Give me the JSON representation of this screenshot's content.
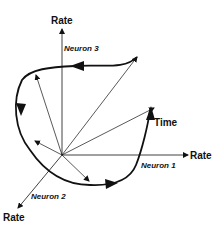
{
  "diagram": {
    "axes": {
      "neuron1": {
        "axis_label": "Rate",
        "name_label": "Neuron 1"
      },
      "neuron2": {
        "axis_label": "Rate",
        "name_label": "Neuron 2"
      },
      "neuron3": {
        "axis_label": "Rate",
        "name_label": "Neuron 3"
      },
      "time": {
        "axis_label": "Time"
      }
    },
    "colors": {
      "stroke": "#111111",
      "background": "#ffffff"
    }
  }
}
